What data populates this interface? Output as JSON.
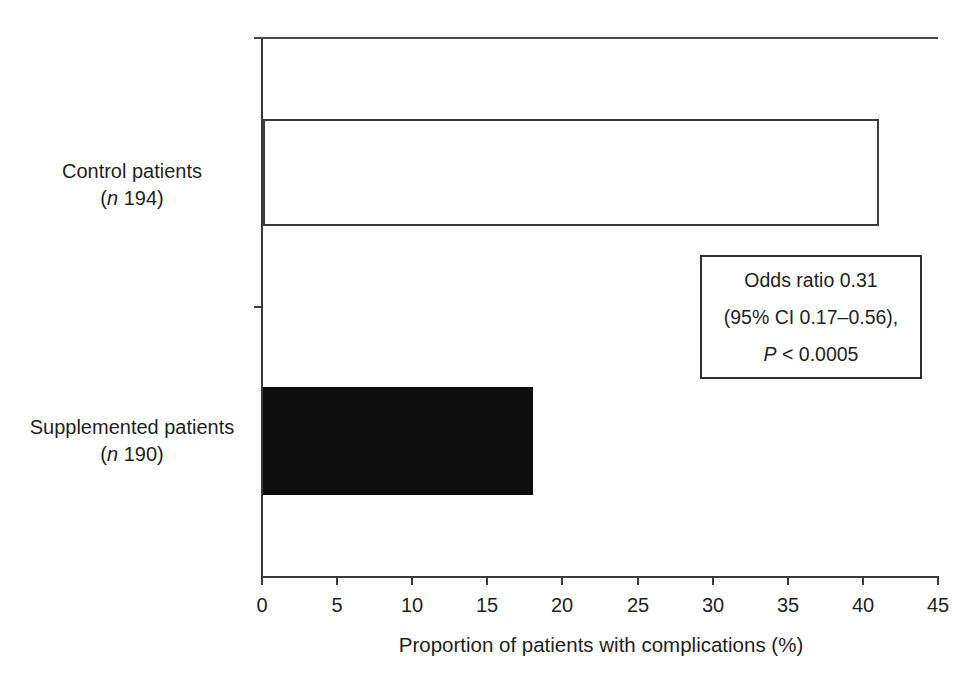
{
  "chart_data": {
    "type": "bar",
    "orientation": "horizontal",
    "title": "",
    "xlabel": "Proportion of patients with complications (%)",
    "ylabel": "",
    "xlim": [
      0,
      45
    ],
    "xticks": [
      0,
      5,
      10,
      15,
      20,
      25,
      30,
      35,
      40,
      45
    ],
    "grid": false,
    "legend": "none",
    "categories": [
      "Control patients (n 194)",
      "Supplemented patients (n 190)"
    ],
    "series": [
      {
        "name": "Control patients",
        "n": 194,
        "value": 41,
        "fill": "#ffffff",
        "border": "#3c3c3c"
      },
      {
        "name": "Supplemented patients",
        "n": 190,
        "value": 18,
        "fill": "#0c0c0c",
        "border": "#0c0c0c"
      }
    ],
    "annotation": "Odds ratio 0.31 (95% CI 0.17–0.56), P < 0.0005"
  },
  "labels": {
    "control": {
      "line1": "Control patients",
      "paren_open": "(",
      "n_italic": "n",
      "count": " 194)"
    },
    "supplemented": {
      "line1": "Supplemented patients",
      "paren_open": "(",
      "n_italic": "n",
      "count": " 190)"
    }
  },
  "annotation_box": {
    "line1": "Odds ratio 0.31",
    "line2": "(95% CI 0.17–0.56),",
    "line3_p_italic": "P",
    "line3_rest": " < 0.0005"
  },
  "axis": {
    "xlabel": "Proportion of patients with complications (%)",
    "tick_labels": [
      "0",
      "5",
      "10",
      "15",
      "20",
      "25",
      "30",
      "35",
      "40",
      "45"
    ]
  },
  "colors": {
    "background": "#ffffff",
    "line": "#3a3a3a",
    "text": "#1f1f1f",
    "bar_control_fill": "#ffffff",
    "bar_control_border": "#3c3c3c",
    "bar_supplemented_fill": "#0c0c0c"
  }
}
